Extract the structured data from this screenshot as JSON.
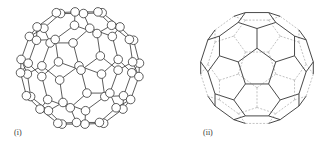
{
  "figure": {
    "panels": [
      {
        "label": "(i)",
        "subject": "C60 ball-and-stick model"
      },
      {
        "label": "(ii)",
        "subject": "C60 truncated icosahedron polyhedron"
      }
    ],
    "colors": {
      "stroke": "#333333",
      "hidden_edge": "#888888",
      "atom_fill": "#ffffff"
    }
  }
}
